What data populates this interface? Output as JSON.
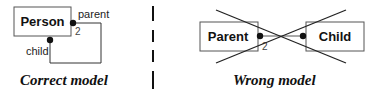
{
  "correct": {
    "class_name": "Person",
    "role_parent": "parent",
    "role_child": "child",
    "multiplicity": "2",
    "caption": "Correct model"
  },
  "wrong": {
    "class_left": "Parent",
    "class_right": "Child",
    "multiplicity": "2",
    "caption": "Wrong model"
  },
  "colors": {
    "stroke": "#1a1a1a",
    "box_stroke": "#555555",
    "background": "#ffffff"
  }
}
